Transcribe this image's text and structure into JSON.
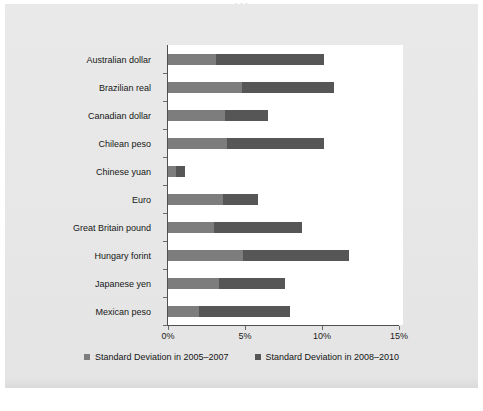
{
  "top_caption_sliver": "·   ·   ·",
  "chart_data": {
    "type": "bar",
    "orientation": "horizontal",
    "stacked": true,
    "title": "",
    "xlabel": "",
    "ylabel": "",
    "xlim": [
      0,
      15
    ],
    "xtick_labels": [
      "0%",
      "5%",
      "10%",
      "15%"
    ],
    "xticks": [
      0,
      5,
      10,
      15
    ],
    "grid": false,
    "legend_position": "bottom",
    "categories": [
      "Australian dollar",
      "Brazilian real",
      "Canadian dollar",
      "Chilean peso",
      "Chinese yuan",
      "Euro",
      "Great Britain pound",
      "Hungary forint",
      "Japanese yen",
      "Mexican peso"
    ],
    "series": [
      {
        "name": "Standard Deviation in 2005–2007",
        "color": "#7d7d7d",
        "values": [
          3.1,
          4.8,
          3.7,
          3.8,
          0.5,
          3.6,
          3.0,
          4.9,
          3.3,
          2.0
        ]
      },
      {
        "name": "Standard Deviation in 2008–2010",
        "color": "#565656",
        "values": [
          7.0,
          6.0,
          2.8,
          6.3,
          0.6,
          2.3,
          5.7,
          6.9,
          4.3,
          5.9
        ]
      }
    ],
    "totals": [
      10.1,
      10.8,
      6.5,
      10.1,
      1.1,
      5.9,
      8.7,
      11.8,
      7.6,
      7.9
    ]
  },
  "legend": {
    "items": [
      {
        "label": "Standard Deviation in 2005–2007",
        "color": "#7d7d7d"
      },
      {
        "label": "Standard Deviation in 2008–2010",
        "color": "#565656"
      }
    ]
  }
}
